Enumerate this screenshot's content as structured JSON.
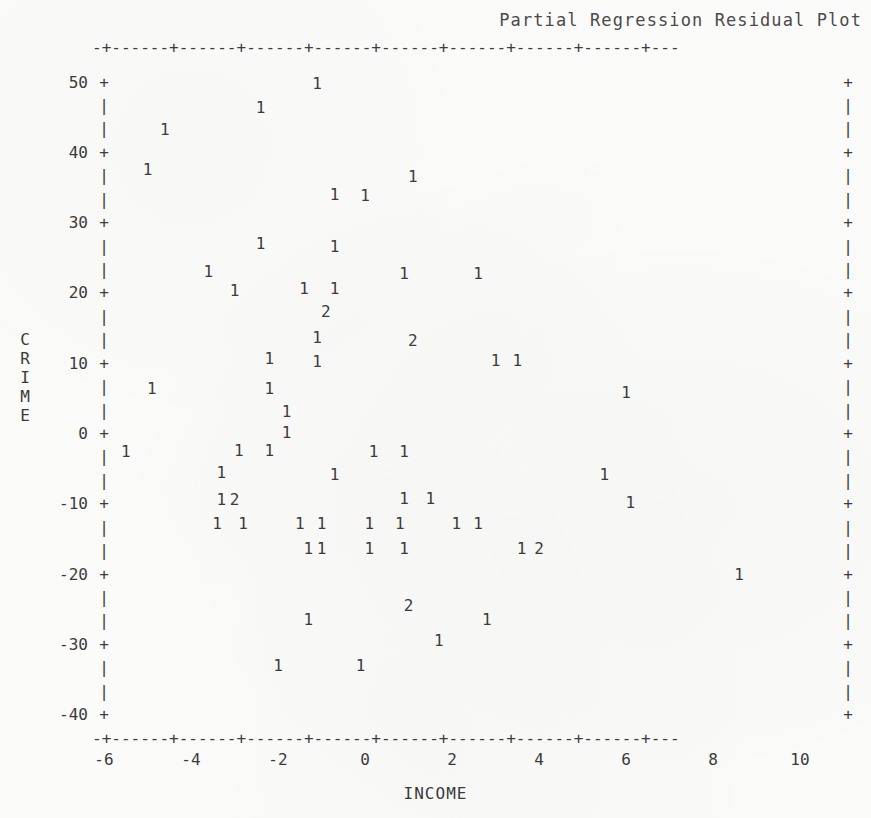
{
  "chart_data": {
    "type": "scatter",
    "title": "Partial Regression Residual Plot",
    "xlabel": "INCOME",
    "ylabel": "CRIME",
    "xlim": [
      -7,
      11
    ],
    "ylim": [
      -40,
      50
    ],
    "grid": false,
    "legend": null,
    "point_glyph": "count digit (1 = one observation, 2 = two coincident observations)",
    "xticks": [
      -6,
      -4,
      -2,
      0,
      2,
      4,
      6,
      8,
      10
    ],
    "xtick_labels": [
      "-6",
      "-4",
      "-2",
      "0",
      "2",
      "4",
      "6",
      "8",
      "10"
    ],
    "yticks": [
      50,
      40,
      30,
      20,
      10,
      0,
      -10,
      -20,
      -30,
      -40
    ],
    "ytick_labels": [
      "50",
      "40",
      "30",
      "20",
      "10",
      "0",
      "-10",
      "-20",
      "-30",
      "-40"
    ],
    "points": [
      {
        "x": -1.1,
        "y": 49.8,
        "label": "1"
      },
      {
        "x": -2.4,
        "y": 46.4,
        "label": "1"
      },
      {
        "x": -4.6,
        "y": 43.2,
        "label": "1"
      },
      {
        "x": -5.0,
        "y": 37.6,
        "label": "1"
      },
      {
        "x": 1.1,
        "y": 36.6,
        "label": "1"
      },
      {
        "x": -0.7,
        "y": 34.0,
        "label": "1"
      },
      {
        "x": 0.0,
        "y": 33.8,
        "label": "1"
      },
      {
        "x": -2.4,
        "y": 27.0,
        "label": "1"
      },
      {
        "x": -0.7,
        "y": 26.6,
        "label": "1"
      },
      {
        "x": -3.6,
        "y": 23.0,
        "label": "1"
      },
      {
        "x": 0.9,
        "y": 22.8,
        "label": "1"
      },
      {
        "x": 2.6,
        "y": 22.8,
        "label": "1"
      },
      {
        "x": -3.0,
        "y": 20.4,
        "label": "1"
      },
      {
        "x": -1.4,
        "y": 20.6,
        "label": "1"
      },
      {
        "x": -0.7,
        "y": 20.6,
        "label": "1"
      },
      {
        "x": -0.9,
        "y": 17.4,
        "label": "2"
      },
      {
        "x": -1.1,
        "y": 13.6,
        "label": "1"
      },
      {
        "x": 1.1,
        "y": 13.2,
        "label": "2"
      },
      {
        "x": -2.2,
        "y": 10.6,
        "label": "1"
      },
      {
        "x": -1.1,
        "y": 10.2,
        "label": "1"
      },
      {
        "x": 3.0,
        "y": 10.4,
        "label": "1"
      },
      {
        "x": 3.5,
        "y": 10.4,
        "label": "1"
      },
      {
        "x": -4.9,
        "y": 6.4,
        "label": "1"
      },
      {
        "x": -2.2,
        "y": 6.4,
        "label": "1"
      },
      {
        "x": 6.0,
        "y": 5.8,
        "label": "1"
      },
      {
        "x": -1.8,
        "y": 3.2,
        "label": "1"
      },
      {
        "x": -1.8,
        "y": 0.2,
        "label": "1"
      },
      {
        "x": -5.5,
        "y": -2.6,
        "label": "1"
      },
      {
        "x": -2.9,
        "y": -2.4,
        "label": "1"
      },
      {
        "x": -2.2,
        "y": -2.4,
        "label": "1"
      },
      {
        "x": 0.2,
        "y": -2.6,
        "label": "1"
      },
      {
        "x": 0.9,
        "y": -2.6,
        "label": "1"
      },
      {
        "x": -3.3,
        "y": -5.6,
        "label": "1"
      },
      {
        "x": -0.7,
        "y": -5.8,
        "label": "1"
      },
      {
        "x": 5.5,
        "y": -5.8,
        "label": "1"
      },
      {
        "x": -3.3,
        "y": -9.4,
        "label": "1"
      },
      {
        "x": -3.0,
        "y": -9.4,
        "label": "2"
      },
      {
        "x": 0.9,
        "y": -9.2,
        "label": "1"
      },
      {
        "x": 1.5,
        "y": -9.2,
        "label": "1"
      },
      {
        "x": 6.1,
        "y": -9.8,
        "label": "1"
      },
      {
        "x": -3.4,
        "y": -12.8,
        "label": "1"
      },
      {
        "x": -2.8,
        "y": -12.8,
        "label": "1"
      },
      {
        "x": -1.5,
        "y": -12.8,
        "label": "1"
      },
      {
        "x": -1.0,
        "y": -12.8,
        "label": "1"
      },
      {
        "x": 0.1,
        "y": -12.8,
        "label": "1"
      },
      {
        "x": 0.8,
        "y": -12.8,
        "label": "1"
      },
      {
        "x": 2.1,
        "y": -12.8,
        "label": "1"
      },
      {
        "x": 2.6,
        "y": -12.8,
        "label": "1"
      },
      {
        "x": -1.3,
        "y": -16.4,
        "label": "1"
      },
      {
        "x": -1.0,
        "y": -16.4,
        "label": "1"
      },
      {
        "x": 0.1,
        "y": -16.4,
        "label": "1"
      },
      {
        "x": 0.9,
        "y": -16.4,
        "label": "1"
      },
      {
        "x": 3.6,
        "y": -16.4,
        "label": "1"
      },
      {
        "x": 4.0,
        "y": -16.4,
        "label": "2"
      },
      {
        "x": 8.6,
        "y": -20.0,
        "label": "1"
      },
      {
        "x": 1.0,
        "y": -24.4,
        "label": "2"
      },
      {
        "x": -1.3,
        "y": -26.4,
        "label": "1"
      },
      {
        "x": 2.8,
        "y": -26.4,
        "label": "1"
      },
      {
        "x": 1.7,
        "y": -29.4,
        "label": "1"
      },
      {
        "x": -2.0,
        "y": -33.0,
        "label": "1"
      },
      {
        "x": -0.1,
        "y": -33.0,
        "label": "1"
      }
    ]
  },
  "axis_art": {
    "top_rule": "-+------+------+------+------+------+------+------+------+---",
    "bottom_rule": "-+------+------+------+------+------+------+------+------+---",
    "tick_glyph": "+",
    "minor_glyph": "|"
  }
}
